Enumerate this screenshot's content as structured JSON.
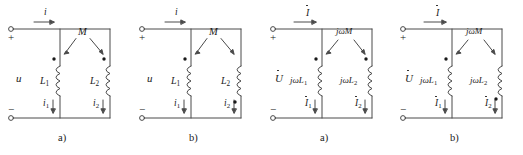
{
  "figure": {
    "stroke_color": "#4a4a4a",
    "text_color": "#1a1a1a",
    "background": "#ffffff"
  },
  "circuits": [
    {
      "id": "time-domain-a",
      "caption": "a)",
      "domain": "time",
      "source_label": "u",
      "plus_sign": "+",
      "minus_sign": "−",
      "input_current": "i",
      "mutual_label": "M",
      "coil1_label": "L",
      "coil1_sub": "1",
      "coil2_label": "L",
      "coil2_sub": "2",
      "current1": "i",
      "current1_sub": "1",
      "current2": "i",
      "current2_sub": "2",
      "dot1_position": "top",
      "dot2_position": "top",
      "phasor": false
    },
    {
      "id": "time-domain-b",
      "caption": "b)",
      "domain": "time",
      "source_label": "u",
      "plus_sign": "+",
      "minus_sign": "−",
      "input_current": "i",
      "mutual_label": "M",
      "coil1_label": "L",
      "coil1_sub": "1",
      "coil2_label": "L",
      "coil2_sub": "2",
      "current1": "i",
      "current1_sub": "1",
      "current2": "i",
      "current2_sub": "2",
      "dot1_position": "top",
      "dot2_position": "bottom",
      "phasor": false
    },
    {
      "id": "phasor-domain-a",
      "caption": "a)",
      "domain": "phasor",
      "source_label": "U",
      "plus_sign": "+",
      "minus_sign": "−",
      "input_current": "I",
      "mutual_label": "jωM",
      "coil1_label": "jωL",
      "coil1_sub": "1",
      "coil2_label": "jωL",
      "coil2_sub": "2",
      "current1": "I",
      "current1_sub": "1",
      "current2": "I",
      "current2_sub": "2",
      "dot1_position": "top",
      "dot2_position": "top",
      "phasor": true
    },
    {
      "id": "phasor-domain-b",
      "caption": "b)",
      "domain": "phasor",
      "source_label": "U",
      "plus_sign": "+",
      "minus_sign": "−",
      "input_current": "I",
      "mutual_label": "jωM",
      "coil1_label": "jωL",
      "coil1_sub": "1",
      "coil2_label": "jωL",
      "coil2_sub": "2",
      "current1": "I",
      "current1_sub": "1",
      "current2": "I",
      "current2_sub": "2",
      "dot1_position": "top",
      "dot2_position": "bottom",
      "phasor": true
    }
  ]
}
